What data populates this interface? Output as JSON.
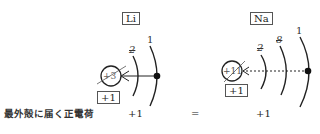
{
  "atoms": [
    {
      "symbol": "Li",
      "nucleus_charge": "+3",
      "effective_charge": "+1",
      "shells": [
        {
          "label": "2",
          "crossed_out": true
        },
        {
          "label": "1",
          "crossed_out": false
        }
      ],
      "arrow_style": "solid"
    },
    {
      "symbol": "Na",
      "nucleus_charge": "+11",
      "effective_charge": "+1",
      "shells": [
        {
          "label": "2",
          "crossed_out": true
        },
        {
          "label": "8",
          "crossed_out": true
        },
        {
          "label": "1",
          "crossed_out": false
        }
      ],
      "arrow_style": "dotted"
    }
  ],
  "comparison": {
    "row_label": "最外殻に届く正電荷",
    "left_value": "+1",
    "operator": "=",
    "right_value": "+1"
  },
  "colors": {
    "line": "#222222",
    "box_border": "#555555"
  }
}
